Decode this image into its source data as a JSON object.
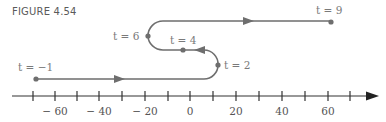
{
  "figure": {
    "title": "FIGURE 4.54",
    "colors": {
      "path": "#6e6e6e",
      "axis": "#333333",
      "label": "#7a7a7a"
    }
  },
  "axis": {
    "min": -70,
    "max": 70,
    "step": 10,
    "tick_labels": [
      {
        "value": -60,
        "text": "− 60"
      },
      {
        "value": -40,
        "text": "− 40"
      },
      {
        "value": -20,
        "text": "− 20"
      },
      {
        "value": 0,
        "text": "0"
      },
      {
        "value": 20,
        "text": "20"
      },
      {
        "value": 40,
        "text": "40"
      },
      {
        "value": 60,
        "text": "60"
      }
    ]
  },
  "points": [
    {
      "t": "t = −1",
      "position": -69
    },
    {
      "t": "t = 2",
      "position": 12
    },
    {
      "t": "t = 4",
      "position": -3
    },
    {
      "t": "t = 6",
      "position": -19
    },
    {
      "t": "t = 9",
      "position": 62
    }
  ],
  "labels": {
    "t_neg1": "t = −1",
    "t_2": "t = 2",
    "t_4": "t = 4",
    "t_6": "t = 6",
    "t_9": "t = 9"
  }
}
